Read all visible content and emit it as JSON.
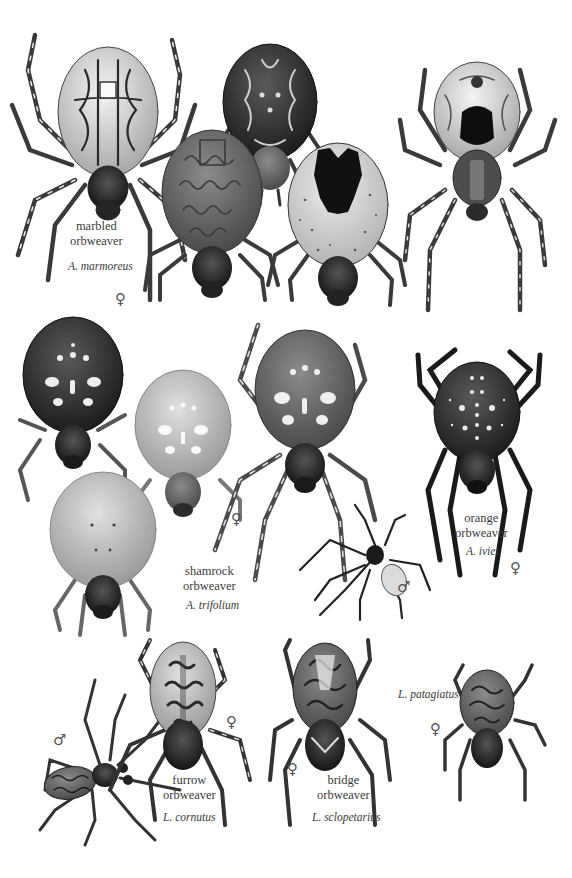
{
  "plate": {
    "species": [
      {
        "id": "marbled",
        "common_name": "marbled\norbweaver",
        "scientific_name": "A. marmoreus",
        "sex_symbol": "♀",
        "label_pos": {
          "common": [
            70,
            219
          ],
          "sci": [
            68,
            259
          ],
          "sex": [
            115,
            292
          ]
        }
      },
      {
        "id": "shamrock",
        "common_name": "shamrock\norbweaver",
        "scientific_name": "A. trifolium",
        "sex_symbol": "♀",
        "label_pos": {
          "common": [
            183,
            564
          ],
          "sci": [
            186,
            598
          ],
          "sex": [
            231,
            512
          ]
        }
      },
      {
        "id": "orange",
        "common_name": "orange\norbweaver",
        "scientific_name": "A. iviei",
        "sex_symbol": "♀",
        "male_symbol": "♂",
        "label_pos": {
          "common": [
            455,
            511
          ],
          "sci": [
            466,
            544
          ],
          "sex": [
            510,
            561
          ],
          "male": [
            397,
            580
          ]
        }
      },
      {
        "id": "furrow",
        "common_name": "furrow\norbweaver",
        "scientific_name": "L. cornutus",
        "sex_symbol": "♀",
        "male_symbol": "♂",
        "label_pos": {
          "common": [
            163,
            773
          ],
          "sci": [
            163,
            810
          ],
          "sex": [
            226,
            715
          ],
          "male": [
            53,
            733
          ]
        }
      },
      {
        "id": "bridge",
        "common_name": "bridge\norbweaver",
        "scientific_name": "L. sclopetarius",
        "sex_symbol": "♀",
        "label_pos": {
          "common": [
            317,
            773
          ],
          "sci": [
            312,
            810
          ],
          "sex": [
            287,
            762
          ]
        }
      },
      {
        "id": "patagiatus",
        "common_name": "",
        "scientific_name": "L. patagiatus",
        "sex_symbol": "♀",
        "label_pos": {
          "sci": [
            398,
            687
          ],
          "sex": [
            430,
            722
          ]
        }
      }
    ],
    "palette": {
      "background": "#ffffff",
      "text": "#3a3a3a",
      "ink": "#1a1a1a",
      "dark_body": "#2b2b2b",
      "mid_body": "#6a6a6a",
      "light_body": "#bdbdbd",
      "pale_body": "#d9d9d9",
      "spot": "#f2f2f2"
    }
  }
}
